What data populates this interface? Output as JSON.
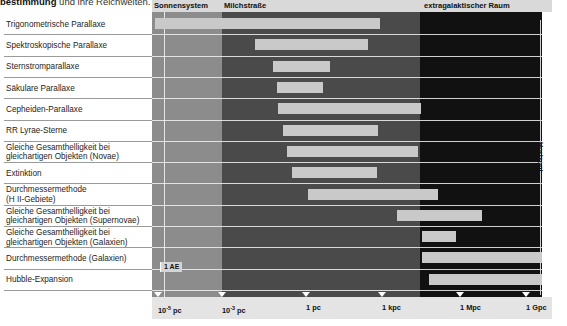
{
  "caption": {
    "bold": "bestimmung",
    "rest": " und ihre Reichweiten."
  },
  "header": {
    "bands": [
      {
        "label": "Sonnensystem",
        "left": 2,
        "key": "solar"
      },
      {
        "label": "Milchstraße",
        "left": 72,
        "key": "milky"
      },
      {
        "label": "extragalaktischer Raum",
        "left": 272,
        "key": "extra"
      }
    ]
  },
  "side": {
    "horizon_label": "Horizont"
  },
  "markers": {
    "au_label": "1 AE"
  },
  "axis": {
    "ticks": [
      {
        "mantissa": "10",
        "exp": "-5",
        "unit": " pc",
        "x": 6
      },
      {
        "mantissa": "10",
        "exp": "-3",
        "unit": " pc",
        "x": 70
      },
      {
        "mantissa": "1",
        "exp": "",
        "unit": " pc",
        "x": 154
      },
      {
        "mantissa": "1",
        "exp": "",
        "unit": " kpc",
        "x": 230
      },
      {
        "mantissa": "1",
        "exp": "",
        "unit": " Mpc",
        "x": 308
      },
      {
        "mantissa": "1",
        "exp": "",
        "unit": " Gpc",
        "x": 374
      }
    ]
  },
  "chart_data": {
    "type": "bar",
    "title": "bestimmung und ihre Reichweiten.",
    "xlabel": "Entfernung",
    "ylabel": "Methode der Entfernungsbestimmung",
    "scale": "log",
    "xlim": [
      "1e-5 pc",
      "1 Gpc"
    ],
    "grid": false,
    "orientation": "horizontal-range",
    "regions": [
      {
        "name": "Sonnensystem",
        "from": "1e-5 pc",
        "to": "~1e-3 pc",
        "color": "#8c8c8c"
      },
      {
        "name": "Milchstraße",
        "from": "~1e-3 pc",
        "to": "~100 kpc",
        "color": "#4a4a4a"
      },
      {
        "name": "extragalaktischer Raum",
        "from": "~100 kpc",
        "to": "1 Gpc",
        "color": "#111111"
      }
    ],
    "categories": [
      "Trigonometrische Parallaxe",
      "Spektroskopische Parallaxe",
      "Sternstromparallaxe",
      "Säkulare Parallaxe",
      "Cepheiden-Parallaxe",
      "RR Lyrae-Sterne",
      "Gleiche Gesamthelligkeit bei gleichartigen Objekten (Novae)",
      "Extinktion",
      "Durchmessermethode (H II-Gebiete)",
      "Gleiche Gesamthelligkeit bei gleichartigen Objekten (Supernovae)",
      "Gleiche Gesamthelligkeit bei gleichartigen Objekten (Galaxien)",
      "Durchmessermethode (Galaxien)",
      "Hubble-Expansion"
    ],
    "ranges": [
      {
        "method": "Trigonometrische Parallaxe",
        "start": "1e-5 pc",
        "end": "~3 pc"
      },
      {
        "method": "Spektroskopische Parallaxe",
        "start": "~0.6 pc",
        "end": "~500 kpc"
      },
      {
        "method": "Sternstromparallaxe",
        "start": "~1.5 pc",
        "end": "~40 pc"
      },
      {
        "method": "Säkulare Parallaxe",
        "start": "~1.5 pc",
        "end": "~20 pc"
      },
      {
        "method": "Cepheiden-Parallaxe",
        "start": "~2 pc",
        "end": "~3 Mpc"
      },
      {
        "method": "RR Lyrae-Sterne",
        "start": "~3 pc",
        "end": "~150 kpc"
      },
      {
        "method": "Gleiche Gesamthelligkeit bei gleichartigen Objekten (Novae)",
        "start": "~3 pc",
        "end": "~2 Mpc"
      },
      {
        "method": "Extinktion",
        "start": "~5 pc",
        "end": "~40 kpc"
      },
      {
        "method": "Durchmessermethode (H II-Gebiete)",
        "start": "~60 pc",
        "end": "~5 Mpc"
      },
      {
        "method": "Gleiche Gesamthelligkeit bei gleichartigen Objekten (Supernovae)",
        "start": "~1 Mpc",
        "end": "~300 Mpc"
      },
      {
        "method": "Gleiche Gesamthelligkeit bei gleichartigen Objekten (Galaxien)",
        "start": "~3 Mpc",
        "end": "~40 Mpc"
      },
      {
        "method": "Durchmessermethode (Galaxien)",
        "start": "~3 Mpc",
        "end": "~1 Gpc"
      },
      {
        "method": "Hubble-Expansion",
        "start": "~4 Mpc",
        "end": "~1 Gpc"
      }
    ],
    "annotations": [
      {
        "text": "1 AE",
        "at": "~5e-6 pc"
      },
      {
        "text": "Horizont",
        "at": "right edge"
      }
    ]
  },
  "rows": [
    {
      "label1": "Trigonometrische Parallaxe",
      "label2": "",
      "bar": {
        "left": 3,
        "width": 164,
        "tone": "lite"
      },
      "bar2": {
        "left": 167,
        "width": 61,
        "tone": "lite"
      }
    },
    {
      "label1": "Spektroskopische Parallaxe",
      "label2": "",
      "bar": {
        "left": 103,
        "width": 113,
        "tone": "lite"
      }
    },
    {
      "label1": "Sternstromparallaxe",
      "label2": "",
      "bar": {
        "left": 121,
        "width": 57,
        "tone": "lite"
      }
    },
    {
      "label1": "Säkulare Parallaxe",
      "label2": "",
      "bar": {
        "left": 125,
        "width": 46,
        "tone": "lite"
      }
    },
    {
      "label1": "Cepheiden-Parallaxe",
      "label2": "",
      "bar": {
        "left": 126,
        "width": 143,
        "tone": "lite"
      }
    },
    {
      "label1": "RR Lyrae-Sterne",
      "label2": "",
      "bar": {
        "left": 131,
        "width": 95,
        "tone": "lite"
      }
    },
    {
      "label1": "Gleiche Gesamthelligkeit bei",
      "label2": "gleichartigen Objekten (Novae)",
      "bar": {
        "left": 135,
        "width": 131,
        "tone": "lite"
      }
    },
    {
      "label1": "Extinktion",
      "label2": "",
      "bar": {
        "left": 140,
        "width": 85,
        "tone": "lite"
      }
    },
    {
      "label1": "Durchmessermethode",
      "label2": "(H II-Gebiete)",
      "bar": {
        "left": 156,
        "width": 130,
        "tone": "lite"
      }
    },
    {
      "label1": "Gleiche Gesamthelligkeit bei",
      "label2": "gleichartigen Objekten (Supernovae)",
      "bar": {
        "left": 245,
        "width": 85,
        "tone": "lite"
      }
    },
    {
      "label1": "Gleiche Gesamthelligkeit bei",
      "label2": "gleichartigen Objekten (Galaxien)",
      "bar": {
        "left": 270,
        "width": 34,
        "tone": "lite"
      }
    },
    {
      "label1": "Durchmessermethode (Galaxien)",
      "label2": "",
      "bar": {
        "left": 270,
        "width": 120,
        "tone": "lite"
      }
    },
    {
      "label1": "Hubble-Expansion",
      "label2": "",
      "bar": {
        "left": 277,
        "width": 113,
        "tone": "lite"
      }
    }
  ]
}
